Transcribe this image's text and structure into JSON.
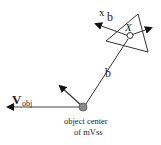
{
  "diagram": {
    "labels": {
      "v": "V",
      "v_sub": "obj",
      "xb_x": "x",
      "xb_b": "b",
      "point_x": "X",
      "b": "b",
      "center_line1": "object center",
      "center_line2": "of mVss"
    },
    "colors": {
      "line": "#333333",
      "center_dot": "#8a8a8a",
      "background": "#ffffff"
    }
  }
}
